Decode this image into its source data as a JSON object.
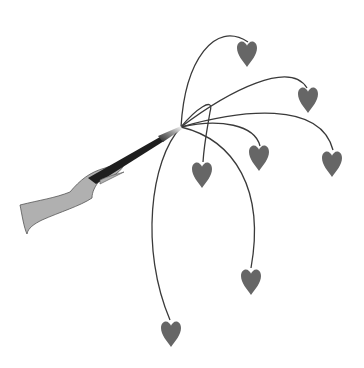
{
  "scene": {
    "description": "Hand holding a magic wand with hearts on curved strings sprouting from its tip",
    "background": "#ffffff",
    "hand_color": "#b0b0b0",
    "wand_color": "#1e1e1e",
    "heart_color": "#666666",
    "string_color": "#3a3a3a",
    "origin": [
      181,
      127
    ],
    "hearts_count": 7
  }
}
